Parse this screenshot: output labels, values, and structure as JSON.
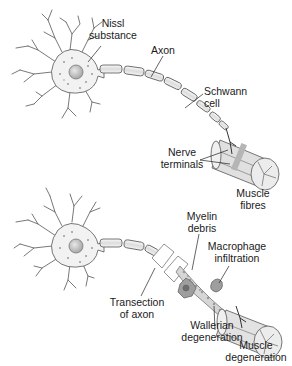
{
  "figure": {
    "top_panel": {
      "title": "Intact neuron",
      "labels": {
        "nissl_line1": "Nissl",
        "nissl_line2": "substance",
        "axon": "Axon",
        "schwann_line1": "Schwann",
        "schwann_line2": "cell",
        "nerve_line1": "Nerve",
        "nerve_line2": "terminals",
        "muscle_line1": "Muscle",
        "muscle_line2": "fibres"
      }
    },
    "bottom_panel": {
      "title": "Transected neuron",
      "labels": {
        "transection_line1": "Transection",
        "transection_line2": "of axon",
        "myelin_line1": "Myelin",
        "myelin_line2": "debris",
        "macrophage_line1": "Macrophage",
        "macrophage_line2": "infiltration",
        "wallerian_line1": "Wallerian",
        "wallerian_line2": "degeneration",
        "muscle_line1": "Muscle",
        "muscle_line2": "degeneration"
      }
    },
    "colors": {
      "stroke": "#555555",
      "cell_fill": "#f2f2f2",
      "nucleus": "#bdbdbd",
      "muscle": "#d9d9d9",
      "text": "#1a1a1a"
    }
  }
}
